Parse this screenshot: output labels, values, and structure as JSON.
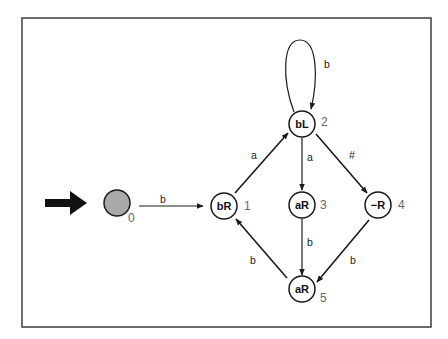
{
  "diagram": {
    "type": "state-machine",
    "start_marker": "thick-right-arrow",
    "colors": {
      "frame": "#4a4a4a",
      "stroke": "#1a1a1a",
      "start_fill": "#a9a9a9",
      "state_number": "#666666"
    },
    "states": [
      {
        "id": "0",
        "label": "",
        "number": "0",
        "initial": true
      },
      {
        "id": "1",
        "label": "bR",
        "number": "1"
      },
      {
        "id": "2",
        "label": "bL",
        "number": "2"
      },
      {
        "id": "3",
        "label": "aR",
        "number": "3"
      },
      {
        "id": "4",
        "label": "−R",
        "number": "4"
      },
      {
        "id": "5",
        "label": "aR",
        "number": "5"
      }
    ],
    "edges": [
      {
        "from": "0",
        "to": "1",
        "label": "b"
      },
      {
        "from": "1",
        "to": "2",
        "label": "a"
      },
      {
        "from": "2",
        "to": "2",
        "label": "b"
      },
      {
        "from": "2",
        "to": "3",
        "label": "a"
      },
      {
        "from": "2",
        "to": "4",
        "label": "#"
      },
      {
        "from": "3",
        "to": "5",
        "label": "b"
      },
      {
        "from": "4",
        "to": "5",
        "label": "b"
      },
      {
        "from": "5",
        "to": "1",
        "label": "b"
      }
    ]
  }
}
